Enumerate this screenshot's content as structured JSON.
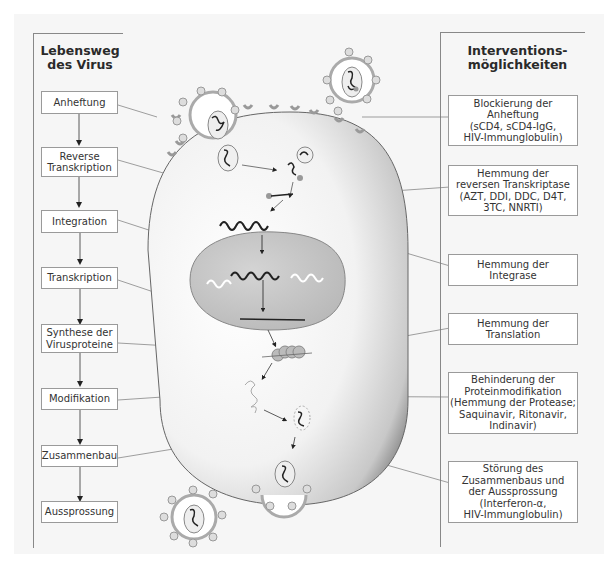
{
  "left_panel": {
    "title": "Lebensweg\ndes Virus",
    "steps": [
      {
        "label": "Anheftung"
      },
      {
        "label": "Reverse\nTranskription"
      },
      {
        "label": "Integration"
      },
      {
        "label": "Transkription"
      },
      {
        "label": "Synthese der\nVirusproteine"
      },
      {
        "label": "Modifikation"
      },
      {
        "label": "Zusammenbau"
      },
      {
        "label": "Aussprossung"
      }
    ]
  },
  "right_panel": {
    "title": "Interventions-\nmöglichkeiten",
    "interventions": [
      {
        "label": "Blockierung der\nAnheftung\n(sCD4, sCD4-IgG,\nHIV-Immunglobulin)"
      },
      {
        "label": "Hemmung der\nreversen Transkriptase\n(AZT, DDI, DDC, D4T,\n3TC, NNRTI)"
      },
      {
        "label": "Hemmung der\nIntegrase"
      },
      {
        "label": "Hemmung der\nTranslation"
      },
      {
        "label": "Behinderung der\nProteinmodifikation\n(Hemmung der Protease;\nSaquinavir, Ritonavir,\nIndinavir)"
      },
      {
        "label": "Störung des\nZusammenbaus und\nder Aussprossung\n(Interferon-α,\nHIV-Immunglobulin)"
      }
    ]
  },
  "colors": {
    "cell_fill": "#e8e8e8",
    "nucleus_fill": "#c4c4c4",
    "virus_envelope": "#b0b0b0",
    "box_border": "#9a9a9a"
  }
}
